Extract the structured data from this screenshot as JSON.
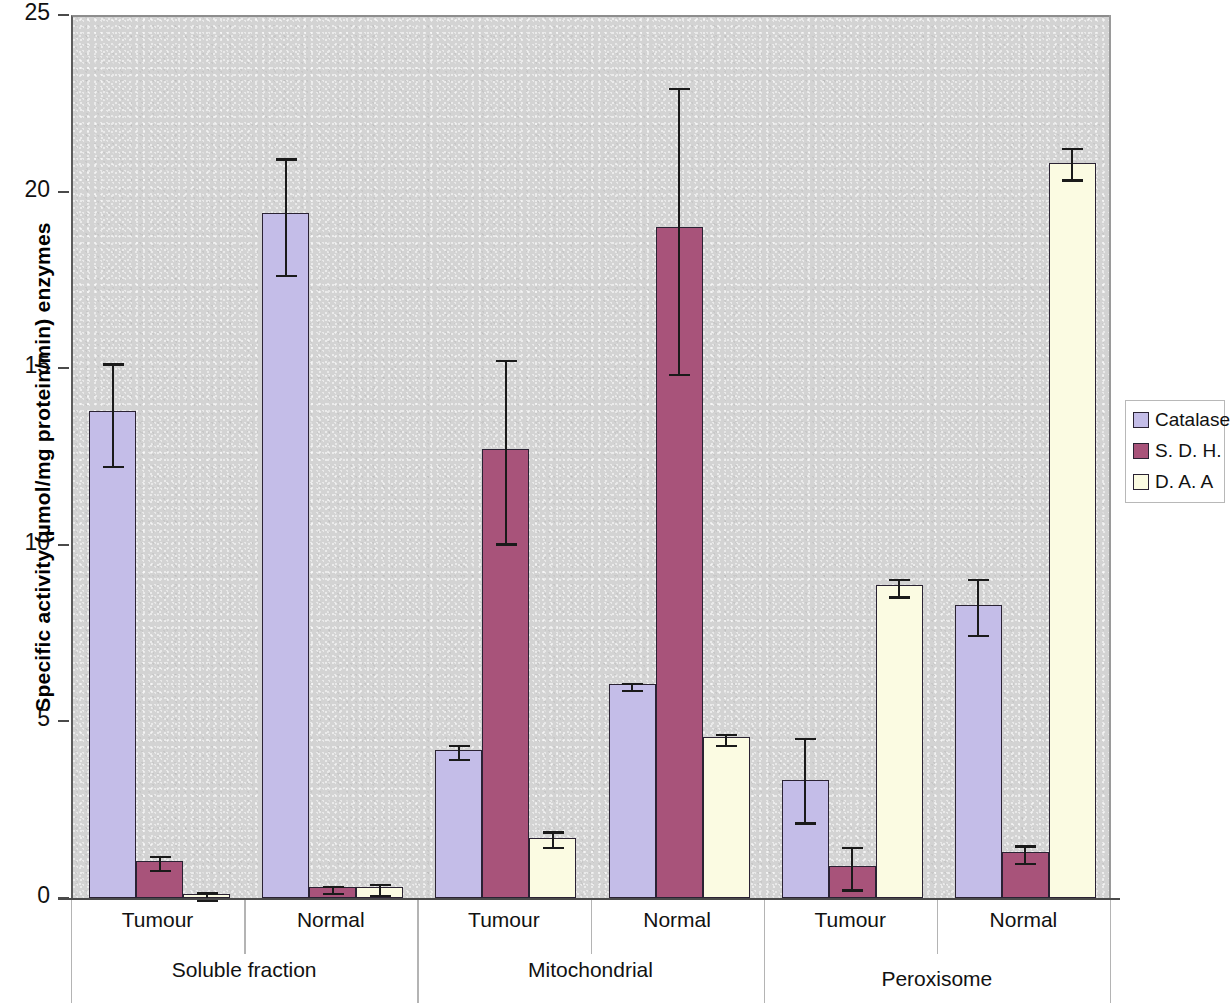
{
  "chart_data": {
    "type": "bar",
    "title": "",
    "xlabel": "",
    "ylabel": "Specific activity (µmol/mg protein/min) enzymes",
    "ylim": [
      0,
      25
    ],
    "yticks": [
      0,
      5,
      10,
      15,
      20,
      25
    ],
    "grid": false,
    "legend_position": "right",
    "legend": [
      "Catalase",
      "S. D. H.",
      "D. A. A"
    ],
    "group_labels": [
      "Soluble fraction",
      "Mitochondrial",
      "Peroxisome"
    ],
    "categories": [
      "Tumour",
      "Normal",
      "Tumour",
      "Normal",
      "Tumour",
      "Normal"
    ],
    "series": [
      {
        "name": "Catalase",
        "color": "#c4bde8",
        "values": [
          13.8,
          19.4,
          4.2,
          6.05,
          3.35,
          8.3
        ],
        "err_low": [
          12.3,
          17.7,
          4.0,
          5.95,
          2.2,
          7.5
        ],
        "err_high": [
          15.2,
          21.0,
          4.4,
          6.15,
          4.6,
          9.1
        ]
      },
      {
        "name": "S. D. H.",
        "color": "#a8537a",
        "values": [
          1.05,
          0.3,
          12.7,
          19.0,
          0.9,
          1.3
        ],
        "err_low": [
          0.85,
          0.2,
          10.1,
          14.9,
          0.3,
          1.05
        ],
        "err_high": [
          1.25,
          0.4,
          15.3,
          23.0,
          1.5,
          1.55
        ]
      },
      {
        "name": "D. A. A",
        "color": "#fbfbe2",
        "values": [
          0.1,
          0.3,
          1.7,
          4.55,
          8.85,
          20.8
        ],
        "err_low": [
          0.02,
          0.15,
          1.5,
          4.4,
          8.6,
          20.4
        ],
        "err_high": [
          0.22,
          0.45,
          1.95,
          4.7,
          9.1,
          21.3
        ]
      }
    ]
  },
  "axis": {
    "y_title": "Specific activity (µmol/mg protein/min) enzymes",
    "y_tick_labels": [
      "25",
      "20",
      "15",
      "10",
      "5",
      "0"
    ]
  },
  "legend": {
    "items": [
      {
        "label": "Catalase",
        "color": "#c4bde8"
      },
      {
        "label": "S. D. H.",
        "color": "#a8537a"
      },
      {
        "label": "D. A. A",
        "color": "#fbfbe2"
      }
    ]
  },
  "categories": [
    {
      "label": "Tumour"
    },
    {
      "label": "Normal"
    },
    {
      "label": "Tumour"
    },
    {
      "label": "Normal"
    },
    {
      "label": "Tumour"
    },
    {
      "label": "Normal"
    }
  ],
  "groups": [
    {
      "label": "Soluble fraction"
    },
    {
      "label": "Mitochondrial"
    },
    {
      "label": "Peroxisome"
    }
  ]
}
